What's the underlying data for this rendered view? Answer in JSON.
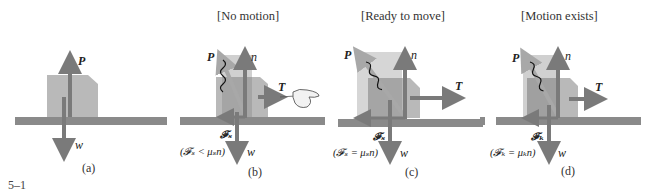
{
  "figure_number": "5–1",
  "colors": {
    "ground": "#8a8a8a",
    "block": "#b9b9b9",
    "block_dark": "#9c9c9c",
    "block_light": "#d0d0d0",
    "arrow": "#7a7a7a",
    "arrow_light": "#a5a5a5"
  },
  "panels": [
    {
      "id": "a",
      "caption": "(a)",
      "title": "",
      "labels": {
        "P": "P",
        "w": "w"
      }
    },
    {
      "id": "b",
      "caption": "(b)",
      "title": "[No motion]",
      "labels": {
        "P": "P",
        "n": "n",
        "T": "T",
        "w": "w",
        "F": "𝓕ₛ"
      },
      "equation": "(𝓕ₛ < μₛn)"
    },
    {
      "id": "c",
      "caption": "(c)",
      "title": "[Ready to move]",
      "labels": {
        "P": "P",
        "n": "n",
        "T": "T",
        "w": "w",
        "F": "𝓕ₛ"
      },
      "equation": "(𝓕ₛ = μₛn)"
    },
    {
      "id": "d",
      "caption": "(d)",
      "title": "[Motion exists]",
      "labels": {
        "P": "P",
        "n": "n",
        "T": "T",
        "w": "w",
        "F": "𝓕ₖ"
      },
      "equation": "(𝓕ₖ = μₖn)"
    }
  ]
}
